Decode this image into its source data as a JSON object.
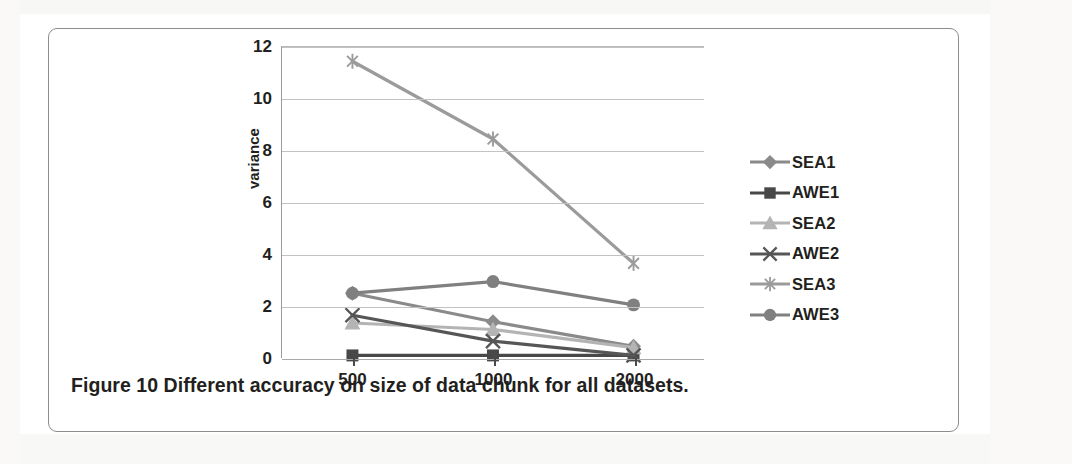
{
  "figure": {
    "caption": "Figure 10 Different accuracy on size of data chunk for all datasets."
  },
  "chart_data": {
    "type": "line",
    "title": "",
    "xlabel": "",
    "ylabel": "variance",
    "categories": [
      "500",
      "1000",
      "2000"
    ],
    "ylim": [
      0,
      12
    ],
    "yticks": [
      0,
      2,
      4,
      6,
      8,
      10,
      12
    ],
    "grid": true,
    "legend_position": "right",
    "series": [
      {
        "name": "SEA1",
        "marker": "diamond",
        "color": "#8a8a8a",
        "values": [
          2.5,
          1.4,
          0.45
        ]
      },
      {
        "name": "AWE1",
        "marker": "square",
        "color": "#484848",
        "values": [
          0.1,
          0.1,
          0.1
        ]
      },
      {
        "name": "SEA2",
        "marker": "triangle",
        "color": "#b4b4b4",
        "values": [
          1.35,
          1.1,
          0.4
        ]
      },
      {
        "name": "AWE2",
        "marker": "x",
        "color": "#565656",
        "values": [
          1.65,
          0.65,
          0.1
        ]
      },
      {
        "name": "SEA3",
        "marker": "asterisk",
        "color": "#9b9b9b",
        "values": [
          11.45,
          8.45,
          3.65
        ]
      },
      {
        "name": "AWE3",
        "marker": "circle",
        "color": "#808080",
        "values": [
          2.5,
          2.95,
          2.05
        ]
      }
    ]
  }
}
